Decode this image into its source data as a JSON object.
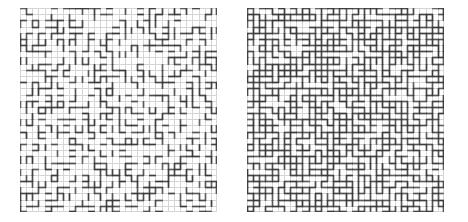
{
  "figure": {
    "background_color": "#ffffff",
    "lattice_color": "#d5d5d5",
    "bond_color": "#383838",
    "panels": [
      {
        "id": "sparse-lattice",
        "cols": 32,
        "rows": 33,
        "bond_probability": 0.33,
        "seed": 7,
        "x": 20,
        "y": 8,
        "width": 197,
        "height": 204
      },
      {
        "id": "dense-lattice",
        "cols": 32,
        "rows": 33,
        "bond_probability": 0.66,
        "seed": 42,
        "x": 247,
        "y": 8,
        "width": 197,
        "height": 204
      }
    ]
  }
}
